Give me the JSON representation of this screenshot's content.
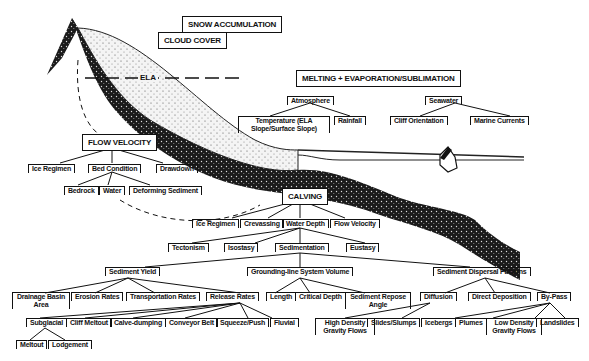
{
  "boxes": {
    "snow": "SNOW ACCUMULATION",
    "cloud": "CLOUD COVER",
    "melting": "MELTING + EVAPORATION/SUBLIMATION",
    "flow": "FLOW VELOCITY",
    "calving": "CALVING"
  },
  "ela": "ELA",
  "atmosphere": {
    "label": "Atmosphere",
    "children": [
      "Temperature (ELA Slope/Surface Slope)",
      "Rainfall"
    ]
  },
  "seawater": {
    "label": "Seawater",
    "children": [
      "Cliff Orientation",
      "Marine Currents"
    ]
  },
  "flow_children": [
    "Ice Regimen",
    "Bed Condition",
    "Drawdown"
  ],
  "bed_children": [
    "Bedrock",
    "Water",
    "Deforming Sediment"
  ],
  "calving_children": [
    "Ice Regimen",
    "Crevassing",
    "Water Depth",
    "Flow Velocity"
  ],
  "water_depth_children": [
    "Tectonism",
    "Isostasy",
    "Sedimentation",
    "Eustasy"
  ],
  "sedimentation_children": [
    "Sediment Yield",
    "Grounding-line System Volume",
    "Sediment Dispersal Patterns"
  ],
  "yield_children": [
    "Drainage Basin Area",
    "Erosion Rates",
    "Transportation Rates",
    "Release Rates"
  ],
  "release_children": [
    "Subglacial",
    "Cliff Meltout",
    "Calve-dumping",
    "Conveyor Belt",
    "Squeeze/Push",
    "Fluvial"
  ],
  "subglacial_children": [
    "Meltout",
    "Lodgement"
  ],
  "volume_children": [
    "Length",
    "Critical Depth",
    "Sediment Repose Angle"
  ],
  "dispersal_children": [
    "Diffusion",
    "Direct Deposition",
    "By-Pass"
  ],
  "diffusion_children": [
    "High Density Gravity Flows",
    "Slides/Slumps"
  ],
  "bypass_children": [
    "Icebergs",
    "Plumes",
    "Low Density Gravity Flows",
    "Landslides"
  ]
}
